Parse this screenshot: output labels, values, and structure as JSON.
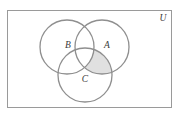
{
  "figure": {
    "type": "venn-diagram",
    "set_count": 3,
    "universe_label": "U",
    "background_color": "#ffffff"
  },
  "universe": {
    "label": "U",
    "label_x": 163,
    "label_y": 19,
    "rect": {
      "x": 7.5,
      "y": 10.5,
      "width": 164,
      "height": 97
    },
    "stroke_color": "#9a9a9a",
    "stroke_width": 1
  },
  "sets": [
    {
      "name": "A",
      "label": "A",
      "label_x": 107,
      "label_y": 46,
      "cx": 102,
      "cy": 47,
      "r": 27,
      "stroke_color": "#8f8f8f",
      "stroke_width": 1.3
    },
    {
      "name": "B",
      "label": "B",
      "label_x": 68,
      "label_y": 46,
      "cx": 67,
      "cy": 47,
      "r": 27,
      "stroke_color": "#8f8f8f",
      "stroke_width": 1.3
    },
    {
      "name": "C",
      "label": "C",
      "label_x": 85,
      "label_y": 80,
      "cx": 85,
      "cy": 75,
      "r": 27,
      "stroke_color": "#8f8f8f",
      "stroke_width": 1.3
    }
  ],
  "shaded_regions": [
    {
      "id": "A-and-C-not-B",
      "description": "A ∩ C − B",
      "fill_color": "#e0e0e0"
    }
  ],
  "colors": {
    "stroke": "#8f8f8f",
    "rect_stroke": "#9a9a9a",
    "shade": "#e0e0e0",
    "label_text": "#3a3a3a",
    "background": "#ffffff"
  }
}
